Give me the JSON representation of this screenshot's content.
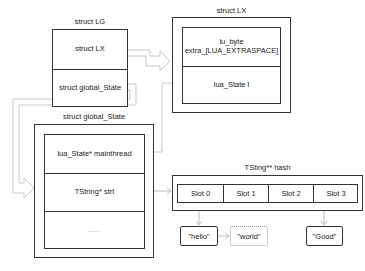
{
  "diagram": {
    "top_strip_text": "",
    "struct_lg": {
      "title": "struct LG",
      "fields": [
        "struct LX",
        "struct global_State"
      ]
    },
    "struct_lx": {
      "title": "struct LX",
      "fields": [
        "lu_byte\nextra_[LUA_EXTRASPACE]",
        "lua_State l"
      ]
    },
    "struct_global_state": {
      "title": "struct global_State",
      "fields": [
        "lua_State* mainthread",
        "TString* strt",
        "......"
      ]
    },
    "hash_table": {
      "title": "TSting** hash",
      "slots": [
        "Slot 0",
        "Slot 1",
        "Slot 2",
        "Slot 3"
      ]
    },
    "strings": [
      {
        "text": "\"hello\"",
        "slot": "Slot 0",
        "style": "solid"
      },
      {
        "text": "\"world\"",
        "slot": "Slot 0",
        "style": "dotted",
        "chained_from": "\"hello\""
      },
      {
        "text": "\"Good\"",
        "slot": "Slot 3",
        "style": "solid"
      }
    ],
    "colors": {
      "border": "#333333",
      "connector": "#bbbbbb",
      "dotted_border": "#999999",
      "background": "#ffffff"
    }
  }
}
